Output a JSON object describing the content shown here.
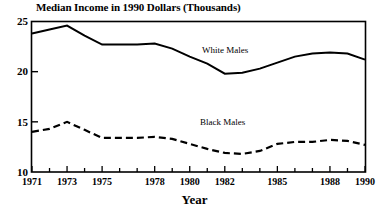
{
  "chart_data": {
    "type": "line",
    "title": "Median Income in 1990 Dollars (Thousands)",
    "xlabel": "Year",
    "ylabel": "",
    "xlim": [
      1971,
      1990
    ],
    "ylim": [
      10,
      25
    ],
    "yticks": [
      10,
      15,
      20,
      25
    ],
    "ytick_labels": [
      "10",
      "15",
      "20",
      "25"
    ],
    "xticks": [
      1971,
      1972,
      1973,
      1974,
      1975,
      1976,
      1977,
      1978,
      1979,
      1980,
      1981,
      1982,
      1983,
      1984,
      1985,
      1986,
      1987,
      1988,
      1989,
      1990
    ],
    "xtick_labels_shown": [
      "1971",
      "1973",
      "1975",
      "1978",
      "1980",
      "1982",
      "1985",
      "1988",
      "1990"
    ],
    "xtick_label_years": [
      1971,
      1973,
      1975,
      1978,
      1980,
      1982,
      1985,
      1988,
      1990
    ],
    "grid": false,
    "legend_position": "inline-annotation",
    "x": [
      1971,
      1972,
      1973,
      1974,
      1975,
      1976,
      1977,
      1978,
      1979,
      1980,
      1981,
      1982,
      1983,
      1984,
      1985,
      1986,
      1987,
      1988,
      1989,
      1990
    ],
    "series": [
      {
        "name": "White Males",
        "style": "solid",
        "color": "#000000",
        "values": [
          23.8,
          24.2,
          24.6,
          23.6,
          22.7,
          22.7,
          22.7,
          22.8,
          22.3,
          21.5,
          20.8,
          19.8,
          19.9,
          20.3,
          20.9,
          21.5,
          21.8,
          21.9,
          21.8,
          21.2
        ]
      },
      {
        "name": "Black Males",
        "style": "dashed",
        "color": "#000000",
        "values": [
          14.0,
          14.3,
          15.0,
          14.2,
          13.4,
          13.4,
          13.4,
          13.5,
          13.3,
          12.8,
          12.3,
          11.9,
          11.8,
          12.1,
          12.8,
          13.0,
          13.0,
          13.2,
          13.1,
          12.7
        ]
      }
    ],
    "annotations": [
      {
        "text": "White Males",
        "x": 1982.0,
        "y": 22.4
      },
      {
        "text": "Black Males",
        "x": 1981.8,
        "y": 15.0
      }
    ]
  },
  "axis": {
    "y_tick_10": "10",
    "y_tick_15": "15",
    "y_tick_20": "20",
    "y_tick_25": "25",
    "x_tick_1971": "1971",
    "x_tick_1973": "1973",
    "x_tick_1975": "1975",
    "x_tick_1978": "1978",
    "x_tick_1980": "1980",
    "x_tick_1982": "1982",
    "x_tick_1985": "1985",
    "x_tick_1988": "1988",
    "x_tick_1990": "1990"
  },
  "labels": {
    "title": "Median Income in 1990 Dollars (Thousands)",
    "x_axis_title": "Year",
    "series_white": "White Males",
    "series_black": "Black Males"
  }
}
